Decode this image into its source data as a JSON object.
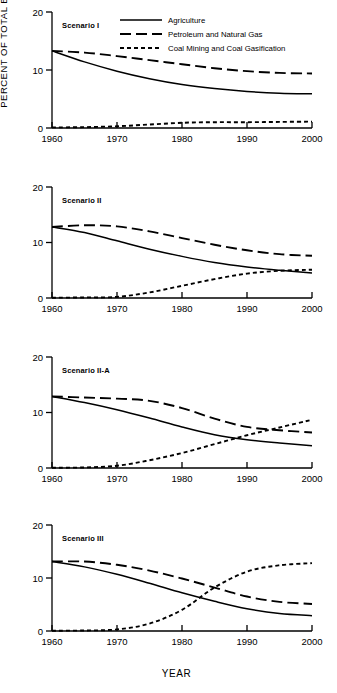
{
  "figure": {
    "ylabel": "PERCENT OF TOTAL EMPLOYMENT",
    "xlabel": "YEAR"
  },
  "legend": {
    "items": [
      {
        "label": "Agriculture",
        "style": "solid",
        "key": "agriculture"
      },
      {
        "label": "Petroleum and Natural Gas",
        "style": "long-dash",
        "key": "petroleum"
      },
      {
        "label": "Coal Mining and Coal Gasification",
        "style": "short-dash",
        "key": "coal"
      }
    ]
  },
  "axis": {
    "x_ticks": [
      "1960",
      "1970",
      "1980",
      "1990",
      "2000"
    ],
    "x_values": [
      1960,
      1970,
      1980,
      1990,
      2000
    ],
    "y_ticks": [
      "0",
      "10",
      "20"
    ],
    "y_values": [
      0,
      10,
      20
    ],
    "xlim": [
      1960,
      2000
    ],
    "ylim": [
      0,
      20
    ]
  },
  "chart_data": {
    "type": "line",
    "title": "",
    "xlabel": "YEAR",
    "ylabel": "PERCENT OF TOTAL EMPLOYMENT",
    "xlim": [
      1960,
      2000
    ],
    "ylim": [
      0,
      20
    ],
    "grid": false,
    "legend_position": "top-right",
    "x": [
      1960,
      1965,
      1970,
      1975,
      1980,
      1985,
      1990,
      1995,
      2000
    ],
    "panels": [
      {
        "name": "Scenario I",
        "series": [
          {
            "name": "Agriculture",
            "style": "solid",
            "values": [
              13.3,
              11.4,
              9.8,
              8.5,
              7.5,
              6.8,
              6.3,
              6.0,
              5.9
            ]
          },
          {
            "name": "Petroleum and Natural Gas",
            "style": "long-dash",
            "values": [
              13.3,
              13.0,
              12.4,
              11.7,
              11.0,
              10.3,
              9.8,
              9.5,
              9.4
            ]
          },
          {
            "name": "Coal Mining and Coal Gasification",
            "style": "short-dash",
            "values": [
              0.1,
              0.15,
              0.3,
              0.6,
              0.9,
              1.0,
              1.0,
              1.05,
              1.1
            ]
          }
        ]
      },
      {
        "name": "Scenario II",
        "series": [
          {
            "name": "Agriculture",
            "style": "solid",
            "values": [
              12.8,
              11.8,
              10.3,
              8.8,
              7.5,
              6.4,
              5.6,
              5.0,
              4.5
            ]
          },
          {
            "name": "Petroleum and Natural Gas",
            "style": "long-dash",
            "values": [
              12.8,
              13.1,
              12.9,
              12.0,
              10.8,
              9.6,
              8.6,
              7.9,
              7.6
            ]
          },
          {
            "name": "Coal Mining and Coal Gasification",
            "style": "short-dash",
            "values": [
              0.05,
              0.1,
              0.2,
              1.0,
              2.2,
              3.4,
              4.4,
              4.9,
              5.1
            ]
          }
        ]
      },
      {
        "name": "Scenario II-A",
        "series": [
          {
            "name": "Agriculture",
            "style": "solid",
            "values": [
              12.9,
              11.8,
              10.5,
              9.0,
              7.4,
              6.0,
              5.1,
              4.5,
              4.0
            ]
          },
          {
            "name": "Petroleum and Natural Gas",
            "style": "long-dash",
            "values": [
              12.9,
              12.7,
              12.5,
              12.1,
              10.8,
              8.9,
              7.4,
              6.8,
              6.4
            ]
          },
          {
            "name": "Coal Mining and Coal Gasification",
            "style": "short-dash",
            "values": [
              0.05,
              0.1,
              0.4,
              1.4,
              2.7,
              4.3,
              5.9,
              7.3,
              8.7
            ]
          }
        ]
      },
      {
        "name": "Scenario III",
        "series": [
          {
            "name": "Agriculture",
            "style": "solid",
            "values": [
              13.1,
              12.1,
              10.7,
              9.0,
              7.2,
              5.6,
              4.2,
              3.3,
              2.9
            ]
          },
          {
            "name": "Petroleum and Natural Gas",
            "style": "long-dash",
            "values": [
              13.1,
              13.1,
              12.5,
              11.4,
              9.9,
              8.2,
              6.5,
              5.5,
              5.1
            ]
          },
          {
            "name": "Coal Mining and Coal Gasification",
            "style": "short-dash",
            "values": [
              0.05,
              0.1,
              0.3,
              1.4,
              4.0,
              8.2,
              11.2,
              12.4,
              12.8
            ]
          }
        ]
      }
    ]
  }
}
